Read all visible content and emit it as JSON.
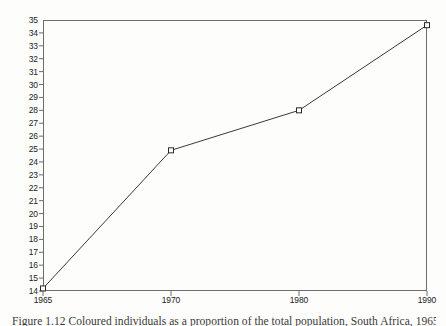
{
  "chart_data": {
    "type": "line",
    "title": "",
    "subtitle": "",
    "xlabel": "",
    "ylabel": "",
    "categories": [
      "1965",
      "1970",
      "1980",
      "1990"
    ],
    "values": [
      14.2,
      24.9,
      28.0,
      34.6
    ],
    "series": [
      {
        "name": "",
        "values": [
          14.2,
          24.9,
          28.0,
          34.6
        ]
      }
    ],
    "ylim": [
      14,
      35
    ],
    "ytick_step": 1,
    "ytick_labels": [
      "35",
      "34",
      "33",
      "32",
      "31",
      "30",
      "29",
      "28",
      "27",
      "26",
      "25",
      "24",
      "23",
      "22",
      "21",
      "20",
      "19",
      "18",
      "17",
      "16",
      "15",
      "14"
    ],
    "xtick_labels": [
      "1965",
      "1970",
      "1980",
      "1990"
    ],
    "grid": false,
    "legend": false,
    "legend_position": "none",
    "marker": "open-square",
    "annotations": []
  },
  "figure": {
    "caption": "Figure 1.12 Coloured individuals as a proportion of the total population, South Africa, 1965–1990"
  },
  "style": {
    "axis_color": "#6d6d6d",
    "line_color": "#3a3a3a",
    "marker_fill": "#ffffff",
    "marker_stroke": "#2a2a2a",
    "text_color": "#1c1c1c",
    "background": "#fdfdfc"
  }
}
